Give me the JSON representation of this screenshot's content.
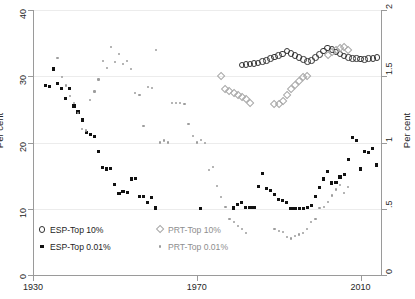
{
  "chart_data": {
    "type": "scatter",
    "title": "",
    "xlabel": "",
    "ylabel": "Per cent",
    "ylabel_right": "Per cent",
    "xlim": [
      1930,
      2015
    ],
    "ylim": [
      0,
      40
    ],
    "ylim_right": [
      0,
      2
    ],
    "xticks": [
      1930,
      1970,
      2010
    ],
    "xticklabels": [
      "1930",
      "1970",
      "2010"
    ],
    "yticks": [
      0,
      10,
      20,
      30,
      40
    ],
    "yticklabels": [
      "0",
      "10",
      "20",
      "30",
      "40"
    ],
    "yticks_right": [
      0,
      0.5,
      1,
      1.5,
      2
    ],
    "yticklabels_right": [
      "0",
      ".5",
      "1",
      "1.5",
      "2"
    ],
    "grid": "horizontal",
    "legend_position": "bottom-left",
    "series": [
      {
        "name": "ESP-Top 10%",
        "axis": "right",
        "marker": "open-circle",
        "color": "#333333",
        "points": [
          [
            1981,
            1.585
          ],
          [
            1982,
            1.588
          ],
          [
            1983,
            1.592
          ],
          [
            1984,
            1.596
          ],
          [
            1985,
            1.6
          ],
          [
            1986,
            1.612
          ],
          [
            1987,
            1.62
          ],
          [
            1988,
            1.632
          ],
          [
            1989,
            1.644
          ],
          [
            1990,
            1.655
          ],
          [
            1991,
            1.668
          ],
          [
            1992,
            1.69
          ],
          [
            1993,
            1.672
          ],
          [
            1994,
            1.655
          ],
          [
            1995,
            1.64
          ],
          [
            1996,
            1.628
          ],
          [
            1997,
            1.612
          ],
          [
            1998,
            1.62
          ],
          [
            1999,
            1.64
          ],
          [
            2000,
            1.665
          ],
          [
            2001,
            1.69
          ],
          [
            2002,
            1.712
          ],
          [
            2003,
            1.7
          ],
          [
            2004,
            1.684
          ],
          [
            2005,
            1.668
          ],
          [
            2006,
            1.652
          ],
          [
            2007,
            1.64
          ],
          [
            2008,
            1.636
          ],
          [
            2009,
            1.632
          ],
          [
            2010,
            1.63
          ],
          [
            2011,
            1.628
          ],
          [
            2012,
            1.632
          ],
          [
            2013,
            1.636
          ],
          [
            2014,
            1.64
          ]
        ]
      },
      {
        "name": "ESP-Top 0.01%",
        "axis": "left",
        "marker": "filled-square",
        "color": "#111111",
        "points": [
          [
            1933,
            28.6
          ],
          [
            1934,
            28.4
          ],
          [
            1935,
            31.1
          ],
          [
            1936,
            28.9
          ],
          [
            1937,
            28.2
          ],
          [
            1938,
            26.6
          ],
          [
            1939,
            28.1
          ],
          [
            1940,
            25.5
          ],
          [
            1941,
            24.6
          ],
          [
            1942,
            23.4
          ],
          [
            1943,
            21.5
          ],
          [
            1944,
            21.2
          ],
          [
            1945,
            20.9
          ],
          [
            1946,
            18.6
          ],
          [
            1947,
            16.2
          ],
          [
            1948,
            16.0
          ],
          [
            1949,
            16.1
          ],
          [
            1950,
            13.7
          ],
          [
            1951,
            12.3
          ],
          [
            1952,
            12.6
          ],
          [
            1953,
            12.5
          ],
          [
            1954,
            14.5
          ],
          [
            1955,
            14.6
          ],
          [
            1956,
            11.8
          ],
          [
            1957,
            11.9
          ],
          [
            1958,
            10.9
          ],
          [
            1959,
            11.7
          ],
          [
            1960,
            10.1
          ],
          [
            1971,
            10.0
          ],
          [
            1979,
            10.1
          ],
          [
            1980,
            10.7
          ],
          [
            1981,
            11.0
          ],
          [
            1982,
            10.2
          ],
          [
            1983,
            10.2
          ],
          [
            1984,
            10.2
          ],
          [
            1985,
            13.3
          ],
          [
            1986,
            15.3
          ],
          [
            1987,
            13.1
          ],
          [
            1988,
            12.7
          ],
          [
            1989,
            12.1
          ],
          [
            1990,
            11.4
          ],
          [
            1991,
            11.2
          ],
          [
            1992,
            10.9
          ],
          [
            1993,
            10.0
          ],
          [
            1994,
            10.0
          ],
          [
            1995,
            10.0
          ],
          [
            1996,
            10.0
          ],
          [
            1997,
            10.2
          ],
          [
            1998,
            10.5
          ],
          [
            1999,
            11.8
          ],
          [
            2000,
            13.2
          ],
          [
            2001,
            14.5
          ],
          [
            2002,
            15.6
          ],
          [
            2003,
            13.9
          ],
          [
            2004,
            14.0
          ],
          [
            2005,
            14.8
          ],
          [
            2006,
            15.2
          ],
          [
            2007,
            17.4
          ],
          [
            2008,
            20.8
          ],
          [
            2009,
            20.3
          ],
          [
            2010,
            16.0
          ],
          [
            2011,
            18.6
          ],
          [
            2012,
            18.5
          ],
          [
            2013,
            19.1
          ],
          [
            2014,
            16.6
          ]
        ]
      },
      {
        "name": "PRT-Top 10%",
        "axis": "right",
        "marker": "open-diamond",
        "color": "#a8a8a8",
        "points": [
          [
            1976,
            1.5
          ],
          [
            1977,
            1.4
          ],
          [
            1978,
            1.39
          ],
          [
            1979,
            1.37
          ],
          [
            1980,
            1.36
          ],
          [
            1981,
            1.34
          ],
          [
            1982,
            1.33
          ],
          [
            1983,
            1.3
          ],
          [
            1989,
            1.29
          ],
          [
            1990,
            1.29
          ],
          [
            1991,
            1.31
          ],
          [
            1992,
            1.36
          ],
          [
            1993,
            1.4
          ],
          [
            1994,
            1.43
          ],
          [
            1995,
            1.46
          ],
          [
            1996,
            1.49
          ],
          [
            1997,
            1.5
          ],
          [
            2002,
            1.66
          ],
          [
            2003,
            1.68
          ],
          [
            2004,
            1.7
          ],
          [
            2005,
            1.71
          ],
          [
            2006,
            1.72
          ],
          [
            2007,
            1.7
          ]
        ]
      },
      {
        "name": "PRT-Top 0.01%",
        "axis": "left",
        "marker": "small-dot",
        "color": "#9d9d9d",
        "points": [
          [
            1936,
            32.8
          ],
          [
            1937,
            29.9
          ],
          [
            1938,
            28.6
          ],
          [
            1939,
            27.0
          ],
          [
            1940,
            26.0
          ],
          [
            1941,
            24.5
          ],
          [
            1942,
            22.0
          ],
          [
            1943,
            21.8
          ],
          [
            1944,
            26.4
          ],
          [
            1945,
            27.7
          ],
          [
            1946,
            29.5
          ],
          [
            1947,
            32.3
          ],
          [
            1948,
            31.2
          ],
          [
            1949,
            34.4
          ],
          [
            1950,
            32.2
          ],
          [
            1951,
            33.3
          ],
          [
            1952,
            31.8
          ],
          [
            1953,
            32.3
          ],
          [
            1954,
            31.1
          ],
          [
            1955,
            27.5
          ],
          [
            1956,
            27.2
          ],
          [
            1957,
            22.5
          ],
          [
            1958,
            28.4
          ],
          [
            1959,
            28.2
          ],
          [
            1960,
            34.0
          ],
          [
            1961,
            20.0
          ],
          [
            1962,
            20.3
          ],
          [
            1963,
            20.0
          ],
          [
            1964,
            26.0
          ],
          [
            1965,
            26.0
          ],
          [
            1966,
            26.0
          ],
          [
            1967,
            25.8
          ],
          [
            1968,
            22.8
          ],
          [
            1969,
            21.0
          ],
          [
            1970,
            20.0
          ],
          [
            1971,
            20.4
          ],
          [
            1972,
            19.9
          ],
          [
            1973,
            15.9
          ],
          [
            1974,
            16.3
          ],
          [
            1975,
            13.4
          ],
          [
            1976,
            11.8
          ],
          [
            1977,
            10.3
          ],
          [
            1978,
            8.5
          ],
          [
            1979,
            8.0
          ],
          [
            1980,
            7.4
          ],
          [
            1981,
            6.9
          ],
          [
            1982,
            6.4
          ],
          [
            1989,
            7.0
          ],
          [
            1990,
            6.7
          ],
          [
            1991,
            6.5
          ],
          [
            1992,
            5.7
          ],
          [
            1993,
            5.5
          ],
          [
            1994,
            5.9
          ],
          [
            1995,
            6.1
          ],
          [
            1996,
            6.4
          ],
          [
            1997,
            6.9
          ],
          [
            1998,
            8.0
          ],
          [
            1999,
            8.5
          ],
          [
            2000,
            10.1
          ],
          [
            2001,
            10.3
          ],
          [
            2002,
            11.0
          ],
          [
            2003,
            12.0
          ],
          [
            2004,
            12.9
          ],
          [
            2005,
            13.6
          ],
          [
            2006,
            12.4
          ],
          [
            2007,
            13.3
          ]
        ]
      }
    ]
  },
  "legend": {
    "items": [
      {
        "label": "ESP-Top 10%",
        "marker": "open-circle",
        "muted": false
      },
      {
        "label": "ESP-Top 0.01%",
        "marker": "filled-square",
        "muted": false
      },
      {
        "label": "PRT-Top 10%",
        "marker": "open-diamond",
        "muted": true
      },
      {
        "label": "PRT-Top 0.01%",
        "marker": "small-dot",
        "muted": true
      }
    ]
  },
  "colors": {
    "esp_dark": "#333333",
    "esp_fill": "#111111",
    "prt_grey": "#a8a8a8",
    "grid": "#ececec",
    "axis": "#9a9a9a"
  }
}
